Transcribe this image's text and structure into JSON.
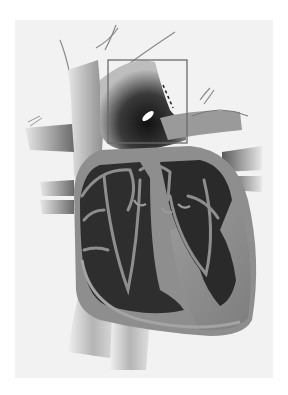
{
  "figure": {
    "highlight_box": {
      "x": 108,
      "y": 60,
      "width": 79,
      "height": 83,
      "stroke": "#6a6a6a"
    },
    "colors": {
      "page_bg": "#ffffff",
      "panel_bg": "#f2f2f2",
      "vessel_light": "#c8c8c8",
      "vessel_mid": "#8c8c8c",
      "vessel_dark": "#2a2a2a",
      "chamber_interior": "#2e2e2e",
      "wall": "#8a8a8a",
      "wall_light": "#a8a8a8",
      "opening": "#ffffff"
    }
  }
}
